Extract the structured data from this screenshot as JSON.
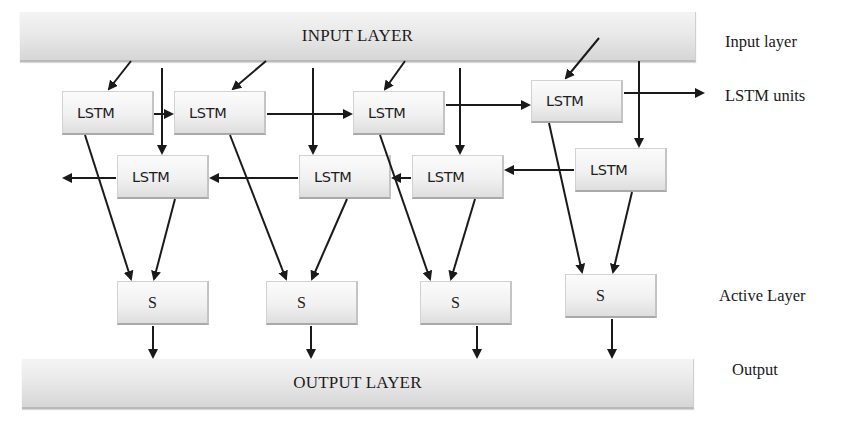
{
  "diagram": {
    "input_bar": {
      "label": "INPUT LAYER"
    },
    "output_bar": {
      "label": "OUTPUT LAYER"
    },
    "forward_units": [
      {
        "label": "LSTM"
      },
      {
        "label": "LSTM"
      },
      {
        "label": "LSTM"
      },
      {
        "label": "LSTM"
      }
    ],
    "backward_units": [
      {
        "label": "LSTM"
      },
      {
        "label": "LSTM"
      },
      {
        "label": "LSTM"
      },
      {
        "label": "LSTM"
      }
    ],
    "activation_units": [
      {
        "label": "S"
      },
      {
        "label": "S"
      },
      {
        "label": "S"
      },
      {
        "label": "S"
      }
    ],
    "side_labels": {
      "input": "Input layer",
      "lstm": "LSTM units",
      "active": "Active Layer",
      "output": "Output"
    },
    "colors": {
      "arrow": "#1a1a1a",
      "box_fill": "#f1f1f1",
      "bar_fill": "#e6e6e6"
    }
  }
}
